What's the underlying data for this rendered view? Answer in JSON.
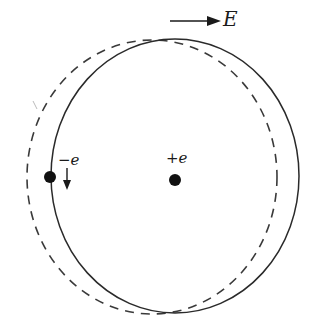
{
  "diagram": {
    "field": {
      "label": "E",
      "direction": "right",
      "arrow_from": [
        170,
        21
      ],
      "arrow_to": [
        218,
        21
      ]
    },
    "nucleus": {
      "label": "+e",
      "cx": 175,
      "cy": 180,
      "r": 6
    },
    "electron": {
      "label": "−e",
      "cx": 50,
      "cy": 177,
      "r": 6,
      "motion_arrow": "down"
    },
    "orbits": [
      {
        "name": "displaced-orbit",
        "style": "solid",
        "cx": 174,
        "cy": 176,
        "rx": 124,
        "ry": 137
      },
      {
        "name": "undisturbed-orbit",
        "style": "dashed",
        "cx": 152,
        "cy": 177,
        "rx": 125,
        "ry": 137
      }
    ],
    "colors": {
      "stroke": "#2a2a2a",
      "background": "#ffffff"
    }
  }
}
